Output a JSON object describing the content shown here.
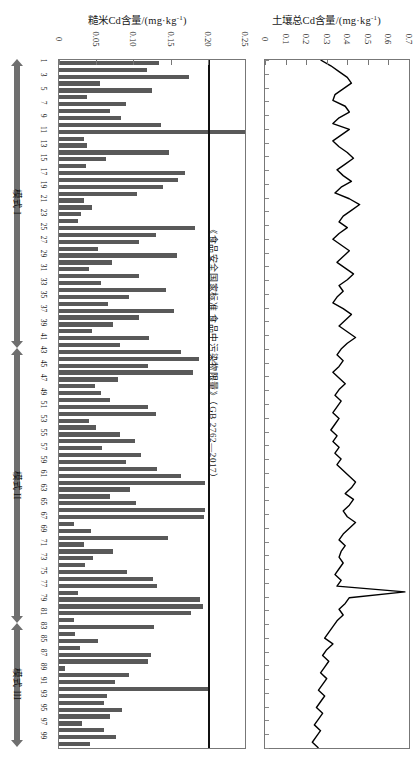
{
  "charts": {
    "left": {
      "title": "糙米Cd含量/(mg·kg",
      "title_sup": "-1",
      "title_tail": ")",
      "threshold_label": "《食品安全国家标准 食品中污染物限量》（GB 2762—2017）",
      "tick_labels": [
        "0",
        "0.05",
        "0.10",
        "0.15",
        "0.20",
        "0.25"
      ]
    },
    "right": {
      "title": "土壤总Cd含量/(mg·kg",
      "title_sup": "-1",
      "title_tail": ")",
      "tick_labels": [
        "0",
        "0.1",
        "0.2",
        "0.3",
        "0.4",
        "0.5",
        "0.6",
        "0.7"
      ]
    }
  },
  "modes": [
    {
      "name": "模式 I",
      "start_index": 1,
      "end_index": 42
    },
    {
      "name": "模式 II",
      "start_index": 43,
      "end_index": 82
    },
    {
      "name": "模式 III",
      "start_index": 83,
      "end_index": 100
    }
  ],
  "sample_tick_labels": [
    "1",
    "3",
    "5",
    "7",
    "9",
    "11",
    "13",
    "15",
    "17",
    "19",
    "21",
    "23",
    "25",
    "27",
    "29",
    "31",
    "33",
    "35",
    "37",
    "39",
    "41",
    "43",
    "45",
    "47",
    "49",
    "51",
    "53",
    "55",
    "57",
    "59",
    "61",
    "63",
    "65",
    "67",
    "69",
    "71",
    "73",
    "75",
    "77",
    "79",
    "81",
    "83",
    "85",
    "87",
    "89",
    "91",
    "93",
    "95",
    "97",
    "99"
  ],
  "colors": {
    "bar": "#595959",
    "threshold_line": "#111111",
    "line_series": "#000000",
    "frame": "#777777",
    "mode_arrow": "#6f6f6f"
  },
  "chart_data": [
    {
      "type": "bar",
      "title": "糙米Cd含量/(mg·kg⁻¹)",
      "xlabel": "糙米Cd含量/(mg·kg⁻¹)",
      "ylabel": "样点编号",
      "orientation": "horizontal",
      "xlim": [
        0,
        0.25
      ],
      "ylim": [
        1,
        100
      ],
      "grid": false,
      "annotations": [
        {
          "type": "vline",
          "value": 0.2,
          "label": "《食品安全国家标准 食品中污染物限量》（GB 2762—2017）"
        }
      ],
      "categories": [
        1,
        2,
        3,
        4,
        5,
        6,
        7,
        8,
        9,
        10,
        11,
        12,
        13,
        14,
        15,
        16,
        17,
        18,
        19,
        20,
        21,
        22,
        23,
        24,
        25,
        26,
        27,
        28,
        29,
        30,
        31,
        32,
        33,
        34,
        35,
        36,
        37,
        38,
        39,
        40,
        41,
        42,
        43,
        44,
        45,
        46,
        47,
        48,
        49,
        50,
        51,
        52,
        53,
        54,
        55,
        56,
        57,
        58,
        59,
        60,
        61,
        62,
        63,
        64,
        65,
        66,
        67,
        68,
        69,
        70,
        71,
        72,
        73,
        74,
        75,
        76,
        77,
        78,
        79,
        80,
        81,
        82,
        83,
        84,
        85,
        86,
        87,
        88,
        89,
        90,
        91,
        92,
        93,
        94,
        95,
        96,
        97,
        98,
        99,
        100
      ],
      "values": [
        0.135,
        0.118,
        0.175,
        0.055,
        0.125,
        0.037,
        0.09,
        0.068,
        0.083,
        0.137,
        0.25,
        0.033,
        0.038,
        0.148,
        0.063,
        0.036,
        0.17,
        0.16,
        0.14,
        0.105,
        0.034,
        0.044,
        0.03,
        0.026,
        0.183,
        0.13,
        0.108,
        0.052,
        0.158,
        0.071,
        0.04,
        0.108,
        0.057,
        0.144,
        0.094,
        0.066,
        0.154,
        0.108,
        0.073,
        0.045,
        0.121,
        0.082,
        0.164,
        0.188,
        0.119,
        0.18,
        0.079,
        0.048,
        0.056,
        0.068,
        0.119,
        0.13,
        0.04,
        0.05,
        0.082,
        0.102,
        0.058,
        0.11,
        0.09,
        0.132,
        0.164,
        0.196,
        0.095,
        0.068,
        0.103,
        0.196,
        0.195,
        0.02,
        0.043,
        0.146,
        0.034,
        0.073,
        0.046,
        0.035,
        0.092,
        0.127,
        0.132,
        0.025,
        0.19,
        0.194,
        0.177,
        0.02,
        0.128,
        0.022,
        0.052,
        0.028,
        0.124,
        0.119,
        0.008,
        0.094,
        0.075,
        0.2,
        0.064,
        0.06,
        0.085,
        0.068,
        0.031,
        0.06,
        0.076,
        0.042
      ]
    },
    {
      "type": "line",
      "title": "土壤总Cd含量/(mg·kg⁻¹)",
      "xlabel": "土壤总Cd含量/(mg·kg⁻¹)",
      "ylabel": "样点编号",
      "orientation": "horizontal",
      "xlim": [
        0,
        0.7
      ],
      "ylim": [
        1,
        100
      ],
      "grid": false,
      "series": [
        {
          "name": "土壤总Cd含量",
          "values": [
            0.27,
            0.32,
            0.36,
            0.4,
            0.42,
            0.38,
            0.34,
            0.33,
            0.39,
            0.41,
            0.36,
            0.33,
            0.41,
            0.37,
            0.33,
            0.36,
            0.4,
            0.43,
            0.39,
            0.35,
            0.38,
            0.42,
            0.37,
            0.34,
            0.41,
            0.46,
            0.42,
            0.38,
            0.36,
            0.4,
            0.36,
            0.33,
            0.37,
            0.41,
            0.38,
            0.35,
            0.39,
            0.43,
            0.4,
            0.36,
            0.38,
            0.35,
            0.33,
            0.38,
            0.42,
            0.39,
            0.36,
            0.4,
            0.44,
            0.4,
            0.37,
            0.35,
            0.38,
            0.36,
            0.33,
            0.36,
            0.39,
            0.36,
            0.34,
            0.37,
            0.35,
            0.33,
            0.36,
            0.34,
            0.32,
            0.35,
            0.33,
            0.36,
            0.34,
            0.37,
            0.35,
            0.38,
            0.41,
            0.44,
            0.42,
            0.39,
            0.43,
            0.41,
            0.38,
            0.4,
            0.44,
            0.41,
            0.38,
            0.36,
            0.39,
            0.37,
            0.36,
            0.38,
            0.36,
            0.34,
            0.37,
            0.35,
            0.68,
            0.41,
            0.39,
            0.36,
            0.38,
            0.35,
            0.33,
            0.31,
            0.29,
            0.33,
            0.3,
            0.28,
            0.31,
            0.29,
            0.27,
            0.3,
            0.28,
            0.26,
            0.29,
            0.27,
            0.25,
            0.28,
            0.26,
            0.24,
            0.27,
            0.25,
            0.23,
            0.26
          ]
        }
      ]
    }
  ]
}
